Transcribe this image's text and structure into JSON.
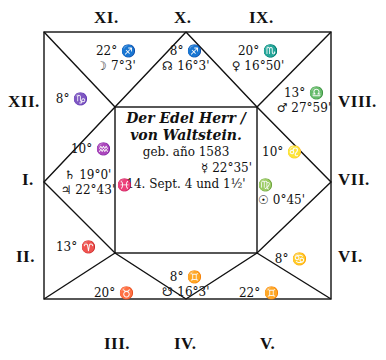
{
  "title": {
    "line1": "Der Edel Herr /",
    "line2": "von Waltstein.",
    "line3": "geb. año 1583",
    "line4": "14. Sept. 4 und 1½'"
  },
  "center_extra": {
    "mercury": "☿ 22°35'",
    "pisces_mark": "♓"
  },
  "house_labels": {
    "I": "I.",
    "II": "II.",
    "III": "III.",
    "IV": "IV.",
    "V": "V.",
    "VI": "VI.",
    "VII": "VII.",
    "VIII": "VIII.",
    "IX": "IX.",
    "X": "X.",
    "XI": "XI.",
    "XII": "XII."
  },
  "houses": {
    "XI": {
      "cusp": "22° ♐",
      "planet": "☽ 7°3'"
    },
    "X": {
      "cusp": "8° ♐",
      "planet": "☊ 16°3'"
    },
    "IX": {
      "cusp": "20° ♏",
      "planet": "♀ 16°50'"
    },
    "XII": {
      "cusp": "8° ♑",
      "planet": ""
    },
    "VIII": {
      "cusp": "13° ♎",
      "planet": "♂ 27°59'"
    },
    "I": {
      "cusp": "10° ♒",
      "planet": "♄ 19°0'",
      "planet2": "♃ 22°43'"
    },
    "VII": {
      "cusp": "10° ♌",
      "planet": "♍",
      "planet2": "☉ 0°45'"
    },
    "II": {
      "cusp": "13° ♈",
      "planet": ""
    },
    "VI": {
      "cusp": "8° ♋",
      "planet": ""
    },
    "III": {
      "cusp": "20° ♉",
      "planet": ""
    },
    "IV": {
      "cusp": "8° ♊",
      "planet": "☋ 16°3'"
    },
    "V": {
      "cusp": "22° ♊",
      "planet": ""
    }
  }
}
